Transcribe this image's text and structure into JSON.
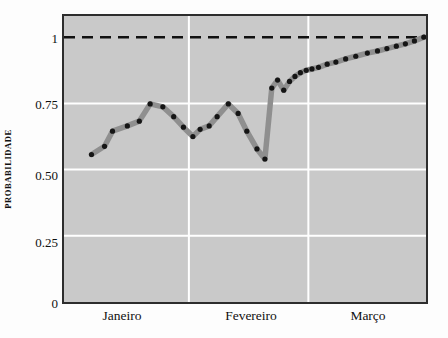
{
  "chart_data": {
    "type": "line",
    "title": "",
    "xlabel": "",
    "ylabel": "PROBABILIDADE",
    "ylim": [
      0,
      1.08
    ],
    "yticks": [
      0,
      0.25,
      0.5,
      0.75,
      1
    ],
    "ytick_labels": [
      "0",
      "0.25",
      "0.50",
      "0.75",
      "1"
    ],
    "xlim": [
      0,
      100
    ],
    "xtick_labels": [
      "Janeiro",
      "Fevereiro",
      "Março"
    ],
    "xtick_positions": [
      16.5,
      51.0,
      83.5
    ],
    "grid": true,
    "gridlines_vertical": [
      34.5,
      67.5
    ],
    "reference_line": {
      "y": 1.0,
      "style": "dashed",
      "color": "#111111"
    },
    "series": [
      {
        "name": "probabilidade",
        "color": "#8f8f8f",
        "marker_color": "#151515",
        "x": [
          7.6,
          11.2,
          13.4,
          17.5,
          20.8,
          23.8,
          27.3,
          30.3,
          33.0,
          35.6,
          37.6,
          40.1,
          42.3,
          45.4,
          48.1,
          50.5,
          53.3,
          55.5,
          57.4,
          59.0,
          60.7,
          62.3,
          63.8,
          65.3,
          66.9,
          68.5,
          70.3,
          72.7,
          75.1,
          77.8,
          80.6,
          83.8,
          86.6,
          89.2,
          91.8,
          94.3,
          96.8,
          99.4
        ],
        "y": [
          0.557,
          0.588,
          0.645,
          0.665,
          0.683,
          0.748,
          0.737,
          0.7,
          0.66,
          0.625,
          0.652,
          0.665,
          0.7,
          0.748,
          0.712,
          0.645,
          0.578,
          0.54,
          0.808,
          0.838,
          0.8,
          0.833,
          0.852,
          0.866,
          0.875,
          0.88,
          0.886,
          0.898,
          0.906,
          0.918,
          0.928,
          0.94,
          0.948,
          0.957,
          0.966,
          0.975,
          0.986,
          1.0
        ]
      }
    ]
  }
}
